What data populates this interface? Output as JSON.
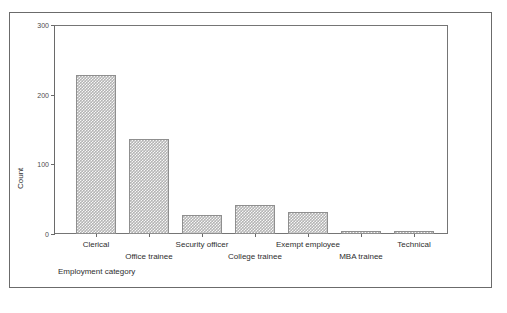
{
  "chart_data": {
    "type": "bar",
    "title": "",
    "subtitle": "",
    "xlabel": "Employment category",
    "ylabel": "Count",
    "categories": [
      "Clerical",
      "Office trainee",
      "Security officer",
      "College trainee",
      "Exempt employee",
      "MBA trainee",
      "Technical"
    ],
    "values": [
      228,
      136,
      27,
      41,
      32,
      5,
      5
    ],
    "ylim": [
      0,
      300
    ],
    "yticks": [
      0,
      100,
      200,
      300
    ],
    "ytick_labels": [
      "0",
      "100",
      "200",
      "300"
    ],
    "grid": false,
    "legend": false,
    "legend_position": "none",
    "bar_fill_color": "#b4b4b4",
    "bar_edge_color": "#8f8f8f",
    "axis_color": "#6a6a6a",
    "frame_color": "#6b6b6b",
    "text_color": "#2e2e2e",
    "background_color": "#ffffff"
  },
  "figure": {
    "outer_border": true,
    "plot_frame": true
  }
}
